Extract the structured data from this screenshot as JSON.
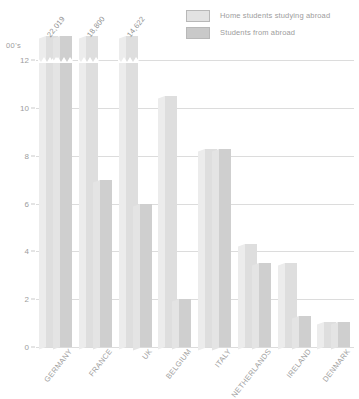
{
  "chart_data": {
    "type": "bar",
    "title": "",
    "subtitle": "",
    "xlabel": "",
    "ylabel": "00's",
    "unit_caption": "00's",
    "ylim": [
      0,
      12
    ],
    "yticks": [
      0,
      2,
      4,
      6,
      8,
      10,
      12
    ],
    "ytick_labels": [
      "0",
      "2",
      "4",
      "6",
      "8",
      "10",
      "12"
    ],
    "grid": true,
    "legend_position": "top-right",
    "categories": [
      "GERMANY",
      "FRANCE",
      "UK",
      "BELGIUM",
      "ITALY",
      "NETHERLANDS",
      "IRELAND",
      "DENMARK"
    ],
    "series": [
      {
        "name": "Home students studying abroad",
        "color": "#dedede",
        "values": [
          12,
          12,
          12,
          10.5,
          8.3,
          4.3,
          3.5,
          1.05
        ],
        "clipped": [
          true,
          true,
          true,
          false,
          false,
          false,
          false,
          false
        ]
      },
      {
        "name": "Students from abroad",
        "color": "#cfcfcf",
        "values": [
          12,
          7.0,
          6.0,
          2.0,
          8.3,
          3.5,
          1.3,
          1.05
        ],
        "clipped": [
          true,
          false,
          false,
          false,
          false,
          false,
          false,
          false
        ]
      }
    ],
    "annotations": [
      {
        "category": "GERMANY",
        "text": "22,019"
      },
      {
        "category": "FRANCE",
        "text": "18,800"
      },
      {
        "category": "UK",
        "text": "14,622"
      }
    ]
  },
  "legend": {
    "items": [
      {
        "label": "Home students studying abroad",
        "swatch": "s0"
      },
      {
        "label": "Students from abroad",
        "swatch": "s1"
      }
    ]
  },
  "colors": {
    "series_light": "#dedede",
    "series_dark": "#cfcfcf",
    "gridline": "#dcdcdc",
    "text": "#9d9d9d",
    "background": "#ffffff"
  }
}
